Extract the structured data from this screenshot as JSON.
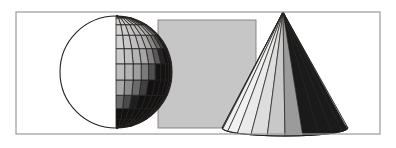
{
  "scene": {
    "title": "3D Primitive Shapes Illustration",
    "width": 396,
    "height": 148,
    "background_color": "#ffffff",
    "frame": {
      "name": "image-border",
      "x": 16,
      "y": 12,
      "width": 364,
      "height": 122,
      "stroke_color": "#9a9a9a",
      "stroke_width": 1.2,
      "fill": "none"
    },
    "objects": [
      {
        "id": "sphere",
        "label": "Wireframe Shaded Sphere",
        "type": "sphere",
        "center_x": 116,
        "center_y": 72,
        "radius": 56,
        "mesh": {
          "latitude_bands": 11,
          "longitude_segments": 20,
          "line_color": "#23201e",
          "line_width": 0.8
        },
        "shading": {
          "model": "lambert",
          "light_direction": "upper-left",
          "highlight_color": "#e8e8e8",
          "midtone_color": "#a8a8a8",
          "shadow_color": "#121212",
          "terminator_fraction": 0.62
        }
      },
      {
        "id": "rectangle",
        "label": "Flat Gray Rectangle",
        "type": "rectangle",
        "x": 158,
        "y": 20,
        "width": 98,
        "height": 108,
        "fill_color": "#c6c6c6",
        "stroke_color": "#7d7d7d",
        "stroke_width": 0.9
      },
      {
        "id": "cone",
        "label": "Faceted Shaded Cone",
        "type": "cone",
        "apex_x": 283,
        "apex_y": 12,
        "base_center_x": 285,
        "base_center_y": 128,
        "base_radius_x": 63,
        "base_radius_y": 8,
        "facets": 22,
        "facet_line_color": "#1f1c1a",
        "facet_line_width": 0.7,
        "shading": {
          "model": "lambert",
          "light_direction": "left",
          "highlight_color": "#fbfbfb",
          "midtone_color": "#b4b4b4",
          "shadow_color": "#1a1a1a"
        }
      }
    ],
    "draw_order": [
      "rectangle",
      "sphere",
      "cone"
    ]
  }
}
